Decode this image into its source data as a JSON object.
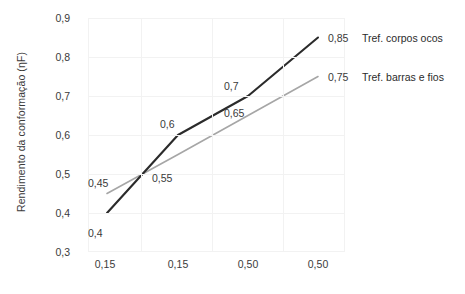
{
  "chart_data": {
    "type": "line",
    "title": "",
    "xlabel": "",
    "ylabel": "Rendimento da conformação (ηF)",
    "categories": [
      "0,15",
      "0,15",
      "0,50",
      "0,50"
    ],
    "ylim": [
      0.3,
      0.9
    ],
    "yticks": [
      "0,3",
      "0,4",
      "0,5",
      "0,6",
      "0,7",
      "0,8",
      "0,9"
    ],
    "ytick_values": [
      0.3,
      0.4,
      0.5,
      0.6,
      0.7,
      0.8,
      0.9
    ],
    "grid": true,
    "legend_position": "right-of-line-ends",
    "series": [
      {
        "name": "Tref. corpos ocos",
        "color": "#2b2b2b",
        "values": [
          0.4,
          0.6,
          0.7,
          0.85
        ],
        "labels": [
          "0,4",
          "0,6",
          "0,7",
          "0,85"
        ]
      },
      {
        "name": "Tref. barras e fios",
        "color": "#a6a6a6",
        "values": [
          0.45,
          0.55,
          0.65,
          0.75
        ],
        "labels": [
          "0,45",
          "0,55",
          "0,65",
          "0,75"
        ]
      }
    ]
  },
  "axis": {
    "y_title": "Rendimento da conformação (ηF)",
    "y_ticks": [
      "0,9",
      "0,8",
      "0,7",
      "0,6",
      "0,5",
      "0,4",
      "0,3"
    ],
    "x_ticks": [
      "0,15",
      "0,15",
      "0,50",
      "0,50"
    ]
  },
  "data_labels": {
    "dark_p1": "0,4",
    "dark_p2": "0,6",
    "dark_p3": "0,7",
    "dark_p4": "0,85",
    "gray_p1": "0,45",
    "gray_p2": "0,55",
    "gray_p3": "0,65",
    "gray_p4": "0,75"
  },
  "legend": {
    "series_dark": "Tref. corpos ocos",
    "series_gray": "Tref. barras e fios"
  },
  "footer": {
    "cut_off_caption": ""
  },
  "colors": {
    "series_dark": "#2b2b2b",
    "series_gray": "#a6a6a6",
    "gridline": "#f2f2f2",
    "text": "#3a3a3a",
    "background": "#ffffff"
  }
}
